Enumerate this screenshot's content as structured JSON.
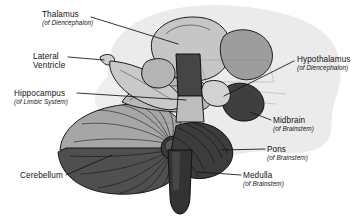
{
  "figure": {
    "kind": "anatomical-diagram",
    "style": "grayscale line illustration with leader-line callouts",
    "background_color": "#ffffff",
    "halo_color": "#e8e8e8",
    "ink_color": "#121212"
  },
  "labels": {
    "thalamus": {
      "name": "Thalamus",
      "qualifier": "(of Diencephalon)"
    },
    "ventricle": {
      "name": "Lateral",
      "name2": "Ventricle",
      "qualifier": ""
    },
    "hippocampus": {
      "name": "Hippocampus",
      "qualifier": "(of Limbic System)"
    },
    "cerebellum": {
      "name": "Cerebellum",
      "qualifier": ""
    },
    "hypothalamus": {
      "name": "Hypothalamus",
      "qualifier": "(of Diencephalon)"
    },
    "midbrain": {
      "name": "Midbrain",
      "qualifier": "(of Brainstem)"
    },
    "pons": {
      "name": "Pons",
      "qualifier": "(of Brainstem)"
    },
    "medulla": {
      "name": "Medulla",
      "qualifier": "(of Brainstem)"
    }
  },
  "palette": {
    "halo": "#e9e9e9",
    "lightest": "#d8d8d8",
    "light": "#c2c2c2",
    "mid_light": "#a9a9a9",
    "mid": "#8e8e8e",
    "mid_dark": "#6f6f6f",
    "dark": "#4a4a4a",
    "darkest": "#333333",
    "outline": "#1b1b1b"
  }
}
